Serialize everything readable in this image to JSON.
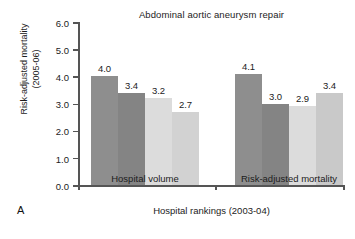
{
  "panel": {
    "label": "A"
  },
  "chart_data": {
    "type": "bar",
    "title": "Abdominal aortic aneurysm repair",
    "xlabel": "Hospital rankings (2003-04)",
    "ylabel_line1": "Risk-adjusted mortality",
    "ylabel_line2": "(2005-06)",
    "ylim": [
      0.0,
      6.0
    ],
    "ytick_labels": [
      "0.0",
      "1.0",
      "2.0",
      "3.0",
      "4.0",
      "5.0",
      "6.0"
    ],
    "ytick_values": [
      0.0,
      1.0,
      2.0,
      3.0,
      4.0,
      5.0,
      6.0
    ],
    "grid": false,
    "legend": "none",
    "categories": [
      "Hospital volume",
      "Risk-adjusted mortality"
    ],
    "groups": [
      {
        "category": "Hospital volume",
        "bars": [
          {
            "value": 4.0,
            "label": "4.0",
            "color": "#8e8e8e"
          },
          {
            "value": 3.4,
            "label": "3.4",
            "color": "#848484"
          },
          {
            "value": 3.2,
            "label": "3.2",
            "color": "#dcdcdc"
          },
          {
            "value": 2.7,
            "label": "2.7",
            "color": "#d2d2d2"
          }
        ]
      },
      {
        "category": "Risk-adjusted mortality",
        "bars": [
          {
            "value": 4.1,
            "label": "4.1",
            "color": "#8e8e8e"
          },
          {
            "value": 3.0,
            "label": "3.0",
            "color": "#848484"
          },
          {
            "value": 2.9,
            "label": "2.9",
            "color": "#dcdcdc"
          },
          {
            "value": 3.4,
            "label": "3.4",
            "color": "#c9c9c9"
          }
        ]
      }
    ]
  }
}
